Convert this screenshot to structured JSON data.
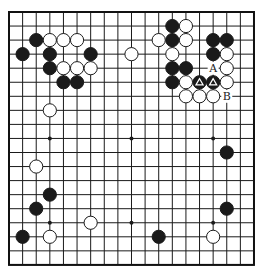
{
  "board": {
    "size": 19,
    "origin_x": 9,
    "origin_y": 12,
    "step_x": 13.61,
    "step_y": 14.05,
    "line_color": "#1a1a1a",
    "border_color": "#111111",
    "background": "#ffffff",
    "star_points": [
      [
        3,
        3
      ],
      [
        9,
        3
      ],
      [
        15,
        3
      ],
      [
        3,
        9
      ],
      [
        9,
        9
      ],
      [
        15,
        9
      ],
      [
        3,
        15
      ],
      [
        9,
        15
      ],
      [
        15,
        15
      ]
    ]
  },
  "stones": {
    "black": [
      [
        2,
        2
      ],
      [
        1,
        3
      ],
      [
        3,
        3
      ],
      [
        6,
        3
      ],
      [
        3,
        4
      ],
      [
        4,
        5
      ],
      [
        5,
        5
      ],
      [
        12,
        1
      ],
      [
        12,
        2
      ],
      [
        15,
        2
      ],
      [
        16,
        2
      ],
      [
        15,
        3
      ],
      [
        12,
        4
      ],
      [
        13,
        4
      ],
      [
        12,
        5
      ],
      [
        14,
        5
      ],
      [
        15,
        5
      ],
      [
        16,
        10
      ],
      [
        16,
        14
      ],
      [
        3,
        13
      ],
      [
        2,
        14
      ],
      [
        1,
        16
      ],
      [
        11,
        16
      ]
    ],
    "white": [
      [
        3,
        2
      ],
      [
        4,
        2
      ],
      [
        5,
        2
      ],
      [
        4,
        4
      ],
      [
        5,
        4
      ],
      [
        6,
        4
      ],
      [
        3,
        7
      ],
      [
        9,
        3
      ],
      [
        13,
        1
      ],
      [
        11,
        2
      ],
      [
        13,
        2
      ],
      [
        12,
        3
      ],
      [
        16,
        3
      ],
      [
        16,
        4
      ],
      [
        13,
        5
      ],
      [
        16,
        5
      ],
      [
        13,
        6
      ],
      [
        14,
        6
      ],
      [
        15,
        6
      ],
      [
        2,
        11
      ],
      [
        6,
        15
      ],
      [
        3,
        16
      ],
      [
        15,
        16
      ]
    ]
  },
  "markers": {
    "triangle": [
      [
        14,
        5
      ],
      [
        15,
        5
      ]
    ]
  },
  "labels": [
    {
      "text": "A",
      "col": 15,
      "row": 4
    },
    {
      "text": "B",
      "col": 16,
      "row": 6
    }
  ],
  "colors": {
    "black_stone": "#1a1a1a",
    "white_stone": "#ffffff",
    "stone_outline": "#1a1a1a",
    "triangle_marker": "#ffffff"
  }
}
